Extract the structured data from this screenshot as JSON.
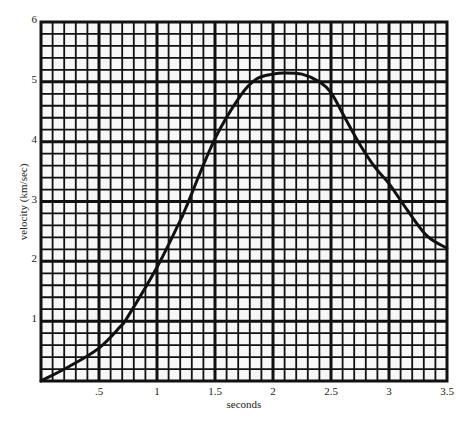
{
  "chart_data": {
    "type": "line",
    "title": "",
    "xlabel": "seconds",
    "ylabel": "velocity (km/sec)",
    "xlim": [
      0,
      3.5
    ],
    "ylim": [
      0,
      6
    ],
    "grid": true,
    "grid_major_x_step": 0.5,
    "grid_minor_x_divisions": 5,
    "grid_major_y_step": 1,
    "grid_minor_y_divisions": 5,
    "x_ticks": [
      {
        "value": 0.5,
        "label": ".5"
      },
      {
        "value": 1,
        "label": "1"
      },
      {
        "value": 1.5,
        "label": "1.5"
      },
      {
        "value": 2,
        "label": "2"
      },
      {
        "value": 2.5,
        "label": "2.5"
      },
      {
        "value": 3,
        "label": "3"
      },
      {
        "value": 3.5,
        "label": "3.5"
      }
    ],
    "y_ticks": [
      {
        "value": 1,
        "label": "1"
      },
      {
        "value": 2,
        "label": "2"
      },
      {
        "value": 3,
        "label": "3"
      },
      {
        "value": 4,
        "label": "4"
      },
      {
        "value": 5,
        "label": "5"
      },
      {
        "value": 6,
        "label": "6"
      }
    ],
    "legend": null,
    "series": [
      {
        "name": "velocity",
        "color": "#111111",
        "x": [
          0,
          0.25,
          0.5,
          0.68,
          0.75,
          1.0,
          1.2,
          1.25,
          1.5,
          1.72,
          1.86,
          2.0,
          2.09,
          2.25,
          2.4,
          2.5,
          2.62,
          2.75,
          2.88,
          3.0,
          3.16,
          3.33,
          3.5
        ],
        "values": [
          0,
          0.25,
          0.55,
          0.9,
          1.08,
          1.9,
          2.68,
          2.9,
          4.05,
          4.77,
          5.05,
          5.13,
          5.15,
          5.13,
          5.0,
          4.82,
          4.4,
          3.95,
          3.57,
          3.3,
          2.85,
          2.42,
          2.22
        ]
      }
    ]
  },
  "colors": {
    "background": "#ffffff",
    "grid": "#111111",
    "curve": "#111111"
  }
}
